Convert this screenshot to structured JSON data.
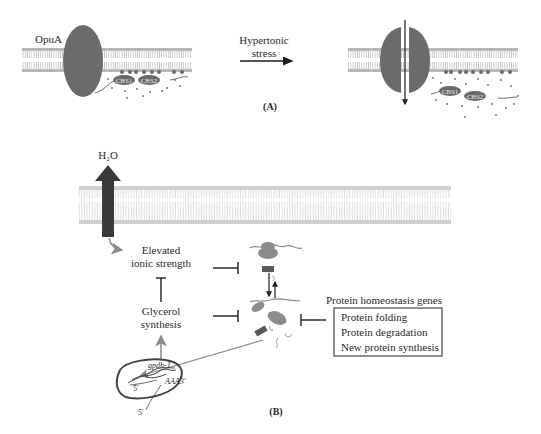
{
  "panel_a": {
    "label": "(A)",
    "transporter_label": "OpuA",
    "domain1": "CBS1",
    "domain2": "CBS2",
    "arrow_label_line1": "Hypertonic",
    "arrow_label_line2": "stress"
  },
  "panel_b": {
    "label": "(B)",
    "water_label": "H₂O",
    "ionic_line1": "Elevated",
    "ionic_line2": "ionic strength",
    "glycerol_line1": "Glycerol",
    "glycerol_line2": "synthesis",
    "gene_label": "gpdh-1",
    "polyA_label": "AAA3'",
    "five_prime_a": "5'",
    "five_prime_b": "5'",
    "homeostasis_title": "Protein homeostasis genes",
    "homeostasis_items": [
      "Protein folding",
      "Protein degradation",
      "New protein synthesis"
    ]
  },
  "colors": {
    "protein_dark": "#6b6b6b",
    "membrane": "#c8c8c8",
    "arrow_dark": "#3a3a3a",
    "arrow_gray": "#8a8a8a",
    "blob_gray": "#8c8c8c"
  }
}
